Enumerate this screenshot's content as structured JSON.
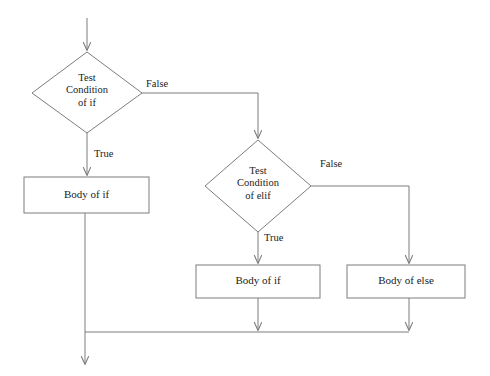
{
  "diagram": {
    "canvas": {
      "width": 490,
      "height": 376,
      "background": "#ffffff"
    },
    "style": {
      "stroke": "#7d7d7d",
      "stroke_width": 1,
      "text_color": "#1c1c1c",
      "shape_fill": "#ffffff"
    },
    "nodes": [
      {
        "id": "decision-if",
        "type": "decision",
        "label": "Test\nCondition\nof if",
        "cx": 87,
        "cy": 93,
        "rx": 55,
        "ry": 41
      },
      {
        "id": "process-body-if-true",
        "type": "process",
        "label": "Body of if",
        "x": 24,
        "y": 177,
        "w": 125,
        "h": 36
      },
      {
        "id": "decision-elif",
        "type": "decision",
        "label": "Test\nCondition\nof elif",
        "cx": 258,
        "cy": 186,
        "rx": 53,
        "ry": 46
      },
      {
        "id": "process-body-elif",
        "type": "process",
        "label": "Body of if",
        "x": 196,
        "y": 265,
        "w": 124,
        "h": 33
      },
      {
        "id": "process-body-else",
        "type": "process",
        "label": "Body of else",
        "x": 347,
        "y": 265,
        "w": 118,
        "h": 33
      }
    ],
    "edge_labels": [
      {
        "id": "label-false-if",
        "text": "False",
        "x": 146,
        "y": 78
      },
      {
        "id": "label-true-if",
        "text": "True",
        "x": 94,
        "y": 148
      },
      {
        "id": "label-false-elif",
        "text": "False",
        "x": 320,
        "y": 158
      },
      {
        "id": "label-true-elif",
        "text": "True",
        "x": 264,
        "y": 232
      }
    ],
    "connectors": [
      {
        "id": "entry-arrow",
        "from": "start",
        "to": "decision-if",
        "branch": ""
      },
      {
        "id": "if-false-connector",
        "from": "decision-if",
        "to": "decision-elif",
        "branch": "False"
      },
      {
        "id": "if-true-connector",
        "from": "decision-if",
        "to": "process-body-if-true",
        "branch": "True"
      },
      {
        "id": "elif-false-connector",
        "from": "decision-elif",
        "to": "process-body-else",
        "branch": "False"
      },
      {
        "id": "elif-true-connector",
        "from": "decision-elif",
        "to": "process-body-elif",
        "branch": "True"
      },
      {
        "id": "merge-body-if-true",
        "from": "process-body-if-true",
        "to": "merge-bus",
        "branch": ""
      },
      {
        "id": "merge-body-elif",
        "from": "process-body-elif",
        "to": "merge-bus",
        "branch": ""
      },
      {
        "id": "merge-body-else",
        "from": "process-body-else",
        "to": "merge-bus",
        "branch": ""
      },
      {
        "id": "exit-arrow",
        "from": "merge-bus",
        "to": "end",
        "branch": ""
      }
    ]
  }
}
